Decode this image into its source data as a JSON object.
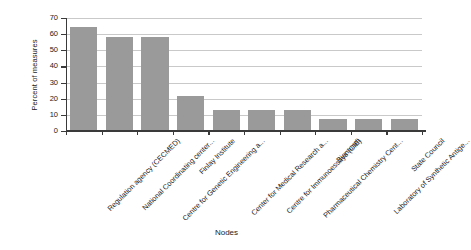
{
  "chart_data": {
    "type": "bar",
    "title": "",
    "xlabel": "Nodes",
    "ylabel": "Percent of measures",
    "categories": [
      "Regulation agency (CECMED)",
      "National Coordinating center...",
      "Centre for Genetic Engineering a...",
      "Finlay Institute",
      "Center for Medical Research a...",
      "Centre for Immunoessays (CIE)",
      "Pharmaceutical Chemistry Cent...",
      "Biomundi",
      "Laboratory of Synthetic Antige...",
      "State Council"
    ],
    "values": [
      64.5,
      58,
      58,
      22,
      13,
      13,
      13,
      7.5,
      7.5,
      7.2
    ],
    "ylim": [
      0,
      70
    ],
    "yticks": [
      0,
      10,
      20,
      30,
      40,
      50,
      60,
      70
    ],
    "ytick_labels": [
      "0",
      "10",
      "20",
      "30",
      "40",
      "50",
      "60",
      "70"
    ],
    "grid": true,
    "grid_axis": "y",
    "legend": false,
    "bar_color": "#9a9a9a",
    "gridline_color": "#c9c9c9",
    "axis_color": "#3a3a3a",
    "background_color": "#ffffff"
  }
}
